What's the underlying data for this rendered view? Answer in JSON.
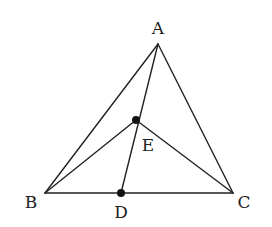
{
  "diagram": {
    "type": "geometry-triangle",
    "points": {
      "A": {
        "label": "A",
        "x": 158,
        "y": 44,
        "label_x": 158,
        "label_y": 34
      },
      "B": {
        "label": "B",
        "x": 45,
        "y": 193,
        "label_x": 31,
        "label_y": 208
      },
      "C": {
        "label": "C",
        "x": 233,
        "y": 193,
        "label_x": 244,
        "label_y": 208
      },
      "D": {
        "label": "D",
        "x": 121,
        "y": 193,
        "label_x": 121,
        "label_y": 218
      },
      "E": {
        "label": "E",
        "x": 136,
        "y": 120,
        "label_x": 148,
        "label_y": 151
      }
    },
    "segments": [
      [
        "A",
        "B"
      ],
      [
        "A",
        "C"
      ],
      [
        "B",
        "C"
      ],
      [
        "A",
        "D"
      ],
      [
        "B",
        "E"
      ],
      [
        "C",
        "E"
      ]
    ],
    "marked_points": [
      "D",
      "E"
    ]
  }
}
